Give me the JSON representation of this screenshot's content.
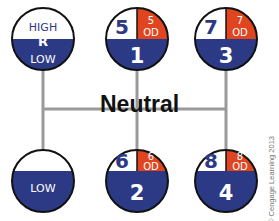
{
  "colors": {
    "blue": "#2c3a86",
    "orange": "#e0451f",
    "white": "#ffffff",
    "line": "#999999",
    "outline": "#111111"
  },
  "neutral_label": "Neutral",
  "credit": "© Cengage Learning 2013",
  "positions": [
    {
      "id": "range",
      "top": "HIGH",
      "center": "R",
      "bottom": "LOW"
    },
    {
      "id": "gate-1-5",
      "top_left": "5",
      "top_right_num": "5",
      "top_right_sub": "OD",
      "bottom": "1"
    },
    {
      "id": "gate-3-7",
      "top_left": "7",
      "top_right_num": "7",
      "top_right_sub": "OD",
      "bottom": "3"
    },
    {
      "id": "low",
      "bottom": "LOW"
    },
    {
      "id": "gate-2-6",
      "top_left": "6",
      "top_right_num": "6",
      "top_right_sub": "OD",
      "bottom": "2"
    },
    {
      "id": "gate-4-8",
      "top_left": "8",
      "top_right_num": "8",
      "top_right_sub": "OD",
      "bottom": "4"
    }
  ]
}
